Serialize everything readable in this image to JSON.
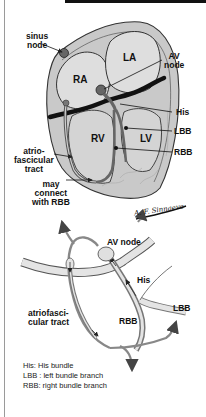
{
  "figure": {
    "type": "anatomical-diagram"
  },
  "top_panel": {
    "chambers": {
      "ra": "RA",
      "la": "LA",
      "rv": "RV",
      "lv": "LV"
    },
    "labels": {
      "sinus_node_1": "sinus",
      "sinus_node_2": "node",
      "av_node_1": "AV",
      "av_node_2": "node",
      "his": "His",
      "lbb": "LBB",
      "rbb": "RBB",
      "af_tract_1": "atrio-",
      "af_tract_2": "fascicular",
      "af_tract_3": "tract",
      "may_connect_1": "may",
      "may_connect_2": "connect",
      "may_connect_3": "with RBB"
    },
    "signature": "A. F. Sinnaeve"
  },
  "bottom_panel": {
    "labels": {
      "av_node": "AV node",
      "his": "His",
      "lbb": "LBB",
      "rbb": "RBB",
      "af_tract_1": "atriofasci-",
      "af_tract_2": "cular tract"
    }
  },
  "legend": {
    "items": [
      "His: His bundle",
      "LBB : left bundle branch",
      "RBB: right bundle branch"
    ]
  },
  "colors": {
    "heart_fill": "#c9c9c9",
    "chamber_fill": "#dedede",
    "outline": "#333333",
    "band": "#111111",
    "node_fill": "#666666",
    "path_gray": "#8a8a8a",
    "lower_fill": "#e4e4e4"
  }
}
